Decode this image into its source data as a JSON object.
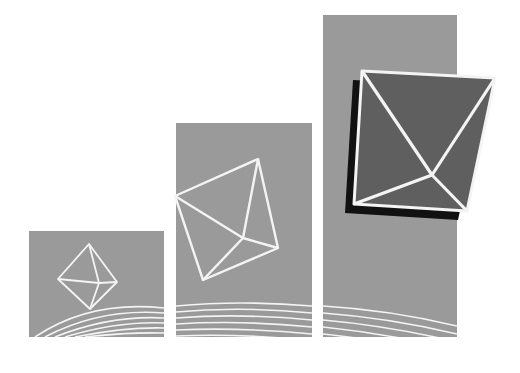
{
  "colors": {
    "background": "#ffffff",
    "panel": "#9a9a9a",
    "dark_face": "#5f5f5f",
    "shadow": "#111111",
    "line": "#f4f4f4"
  },
  "panels": [
    {
      "name": "small",
      "x": 29,
      "y": 231,
      "w": 135,
      "h": 106
    },
    {
      "name": "medium",
      "x": 176,
      "y": 123,
      "w": 136,
      "h": 214
    },
    {
      "name": "large",
      "x": 323,
      "y": 15,
      "w": 134,
      "h": 322
    }
  ],
  "shapes": [
    {
      "name": "small-octahedron",
      "top": [
        89,
        244
      ],
      "left": [
        58,
        279
      ],
      "right": [
        117,
        282
      ],
      "bottom": [
        90,
        309
      ],
      "center": [
        99,
        283
      ]
    },
    {
      "name": "medium-octahedron",
      "top": [
        258,
        159
      ],
      "left": [
        175,
        196
      ],
      "right": [
        278,
        248
      ],
      "bottom": [
        203,
        280
      ],
      "center": [
        243,
        238
      ]
    },
    {
      "name": "large-octahedron",
      "tl": [
        362,
        71
      ],
      "tr": [
        495,
        78
      ],
      "bl": [
        354,
        204
      ],
      "br": [
        467,
        211
      ],
      "center": [
        432,
        175
      ],
      "shadow_offset": [
        -9,
        9
      ]
    }
  ]
}
